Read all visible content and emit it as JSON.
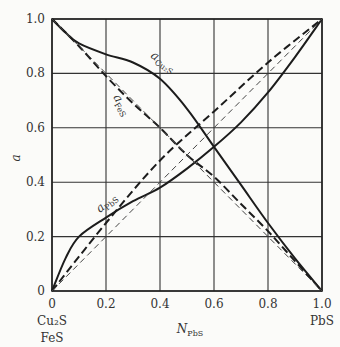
{
  "caption_fragment": "",
  "chart_data": {
    "type": "line",
    "title": "",
    "xlabel": "N_PbS",
    "ylabel": "a",
    "xlim": [
      0,
      1.0
    ],
    "ylim": [
      0,
      1.0
    ],
    "grid": true,
    "x_ticks": [
      "0",
      "0.2",
      "0.4",
      "0.6",
      "0.8",
      "1.0"
    ],
    "y_ticks": [
      "0",
      "0.2",
      "0.4",
      "0.6",
      "0.8",
      "1.0"
    ],
    "x_end_labels": {
      "left_line1": "Cu₂S",
      "left_line2": "FeS",
      "right": "PbS"
    },
    "series": [
      {
        "name": "a_Cu2S",
        "style": "solid",
        "label_main": "a",
        "label_sub": "Cu₂S",
        "x": [
          0,
          0.05,
          0.1,
          0.2,
          0.3,
          0.4,
          0.5,
          0.6,
          0.7,
          0.8,
          0.9,
          1.0
        ],
        "y": [
          1.0,
          0.95,
          0.91,
          0.87,
          0.84,
          0.78,
          0.67,
          0.53,
          0.39,
          0.25,
          0.12,
          0
        ]
      },
      {
        "name": "a_FeS",
        "style": "dashed-heavy",
        "label_main": "a",
        "label_sub": "FeS",
        "x": [
          0,
          0.1,
          0.2,
          0.3,
          0.4,
          0.5,
          0.6,
          0.7,
          0.8,
          0.9,
          1.0
        ],
        "y": [
          1.0,
          0.9,
          0.79,
          0.69,
          0.6,
          0.5,
          0.42,
          0.32,
          0.22,
          0.11,
          0
        ]
      },
      {
        "name": "a_PbS",
        "style": "solid",
        "label_main": "a",
        "label_sub": "PbS",
        "x": [
          0,
          0.05,
          0.1,
          0.2,
          0.3,
          0.4,
          0.5,
          0.6,
          0.7,
          0.8,
          0.9,
          1.0
        ],
        "y": [
          0,
          0.12,
          0.2,
          0.27,
          0.33,
          0.38,
          0.45,
          0.53,
          0.62,
          0.73,
          0.86,
          1.0
        ]
      },
      {
        "name": "a_PbS_dashed",
        "style": "dashed-heavy",
        "x": [
          0,
          0.2,
          0.4,
          0.6,
          0.8,
          1.0
        ],
        "y": [
          0,
          0.25,
          0.48,
          0.66,
          0.84,
          1.0
        ]
      },
      {
        "name": "ideal_decreasing",
        "style": "dashed-thin",
        "x": [
          0,
          1.0
        ],
        "y": [
          1.0,
          0
        ]
      },
      {
        "name": "ideal_increasing",
        "style": "dashed-thin",
        "x": [
          0,
          1.0
        ],
        "y": [
          0,
          1.0
        ]
      }
    ]
  }
}
